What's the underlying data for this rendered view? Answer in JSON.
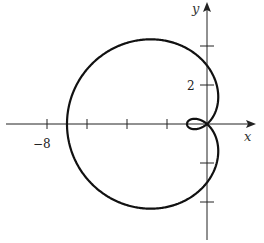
{
  "chart_data": {
    "type": "line",
    "title": "",
    "equation": "r = 3 - 4cos(theta)",
    "params": {
      "a": 3,
      "b": 4
    },
    "xlabel": "x",
    "ylabel": "y",
    "xlim": [
      -9.5,
      2.5
    ],
    "ylim": [
      -5.8,
      6.2
    ],
    "x_tick_values": [
      -8,
      -6,
      -4,
      -2
    ],
    "x_tick_labels": [
      {
        "value": -8,
        "label": "−8"
      }
    ],
    "y_tick_values": [
      -4,
      -2,
      2,
      4
    ],
    "y_tick_labels": [
      {
        "value": 2,
        "label": "2"
      }
    ],
    "grid": false,
    "legend": null,
    "key_points": [
      {
        "theta": "0",
        "x": -1,
        "y": 0
      },
      {
        "theta": "π/2",
        "x": 0,
        "y": 3
      },
      {
        "theta": "π",
        "x": -7,
        "y": 0
      },
      {
        "theta": "3π/2",
        "x": 0,
        "y": -3
      }
    ]
  },
  "labels": {
    "x_axis": "x",
    "y_axis": "y",
    "x_tick_minus8": "−8",
    "y_tick_2": "2"
  }
}
